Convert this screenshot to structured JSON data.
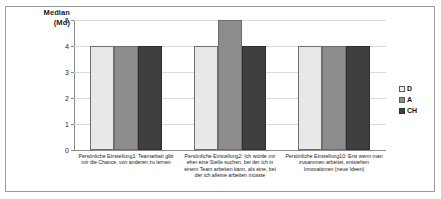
{
  "chart_data": {
    "type": "bar",
    "title": "",
    "ylabel": "Median (Md)",
    "ylabel_lines": [
      "Median",
      "(Md)"
    ],
    "xlabel": "",
    "ylim": [
      0,
      5
    ],
    "yticks": [
      "5",
      "4",
      "3",
      "2",
      "1",
      "0"
    ],
    "grid": true,
    "legend_position": "right",
    "categories": [
      "Persönliche Einstellung1: Teamarbeit gibt mir die Chance, von anderen zu lernen",
      "Persönliche Einstellung2: Ich würde mir eher eine Stelle suchen, bei der ich in einem Team arbeiten kann, als eine, bei der ich alleine arbeiten müsste",
      "Persönliche Einstellung10: Erst wenn man zusammen arbeitet, entstehen Innovationen (neue Ideen)"
    ],
    "series": [
      {
        "name": "D",
        "color": "#e8e8e8",
        "values": [
          4,
          4,
          4
        ]
      },
      {
        "name": "A",
        "color": "#8c8c8c",
        "values": [
          4,
          5,
          4
        ]
      },
      {
        "name": "CH",
        "color": "#3f3f3f",
        "values": [
          4,
          4,
          4
        ]
      }
    ]
  }
}
